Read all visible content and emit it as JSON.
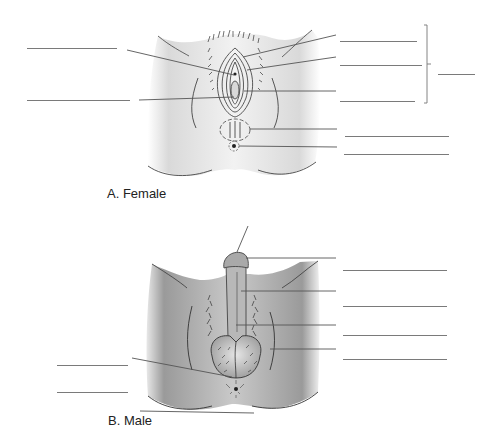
{
  "figure": {
    "panels": [
      {
        "id": "A",
        "caption": "A. Female"
      },
      {
        "id": "B",
        "caption": "B. Male"
      }
    ],
    "female_blanks": [
      {
        "side": "left",
        "x1": 27,
        "x2": 117,
        "y": 48
      },
      {
        "side": "left",
        "x1": 27,
        "x2": 130,
        "y": 100
      },
      {
        "side": "right",
        "x1": 340,
        "x2": 417,
        "y": 41
      },
      {
        "side": "right",
        "x1": 340,
        "x2": 422,
        "y": 65
      },
      {
        "side": "right",
        "x1": 340,
        "x2": 415,
        "y": 101
      },
      {
        "side": "right",
        "x1": 345,
        "x2": 449,
        "y": 136
      },
      {
        "side": "right",
        "x1": 344,
        "x2": 449,
        "y": 154
      },
      {
        "side": "bracket",
        "x1": 438,
        "x2": 475,
        "y": 74
      }
    ],
    "male_blanks": [
      {
        "side": "left",
        "x1": 57,
        "x2": 128,
        "y": 365
      },
      {
        "side": "left",
        "x1": 57,
        "x2": 128,
        "y": 392
      },
      {
        "side": "right",
        "x1": 343,
        "x2": 447,
        "y": 270
      },
      {
        "side": "right",
        "x1": 343,
        "x2": 447,
        "y": 306
      },
      {
        "side": "right",
        "x1": 343,
        "x2": 447,
        "y": 335
      },
      {
        "side": "right",
        "x1": 343,
        "x2": 447,
        "y": 359
      }
    ]
  }
}
